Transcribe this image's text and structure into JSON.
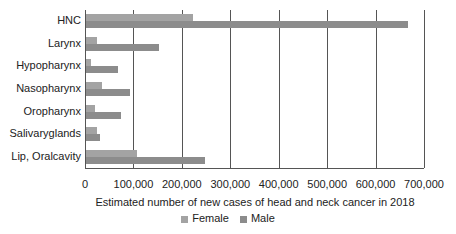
{
  "chart_data": {
    "type": "bar",
    "orientation": "horizontal",
    "title": "",
    "xlabel": "Estimated number of new cases of head and neck cancer in 2018",
    "ylabel": "",
    "xlim": [
      0,
      700000
    ],
    "xticks": [
      "0",
      "100,000",
      "200,000",
      "300,000",
      "400,000",
      "500,000",
      "600,000",
      "700,000"
    ],
    "categories": [
      "HNC",
      "Larynx",
      "Hypopharynx",
      "Nasopharynx",
      "Oropharynx",
      "Salivaryglands",
      "Lip, Oralcavity"
    ],
    "series": [
      {
        "name": "Female",
        "color": "#a3a3a3",
        "values": [
          221000,
          23000,
          11000,
          33000,
          18000,
          22000,
          105000
        ]
      },
      {
        "name": "Male",
        "color": "#8c8c8c",
        "values": [
          665000,
          150000,
          67000,
          90000,
          73000,
          29000,
          246000
        ]
      }
    ],
    "grid": true,
    "legend_position": "bottom"
  },
  "legend": {
    "female": "Female",
    "male": "Male"
  }
}
